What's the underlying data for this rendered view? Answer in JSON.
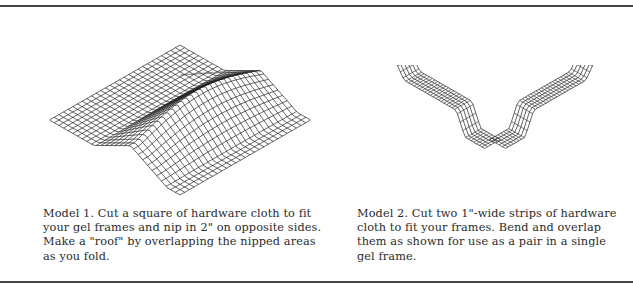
{
  "figures": [
    {
      "id": "model-1",
      "illustration": "hardware-cloth-roof-mesh",
      "caption": "Model 1.  Cut a square of hardware cloth to fit your gel frames and nip in 2\" on opposite sides. Make a \"roof\" by overlapping the nipped areas as you fold."
    },
    {
      "id": "model-2",
      "illustration": "hardware-cloth-crossed-strips",
      "caption": "Model 2.  Cut two 1\"-wide strips of hardware cloth to fit your frames. Bend and overlap them as shown for use as a pair in a single gel frame."
    }
  ],
  "style": {
    "rule_color": "#444444",
    "mesh_color": "#222222",
    "text_color": "#2b2b2b"
  }
}
